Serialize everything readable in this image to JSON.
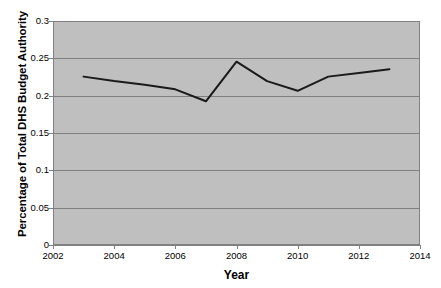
{
  "chart_data": {
    "type": "line",
    "title": "",
    "xlabel": "Year",
    "ylabel": "Percentage of Total DHS Budget Authority",
    "xlim": [
      2002,
      2014
    ],
    "ylim": [
      0,
      0.3
    ],
    "xticks": [
      2002,
      2004,
      2006,
      2008,
      2010,
      2012,
      2014
    ],
    "xtick_labels": [
      "2002",
      "2004",
      "2006",
      "2008",
      "2010",
      "2012",
      "2014"
    ],
    "yticks": [
      0,
      0.05,
      0.1,
      0.15,
      0.2,
      0.25,
      0.3
    ],
    "ytick_labels": [
      "0",
      "0.05",
      "0.1",
      "0.15",
      "0.2",
      "0.25",
      "0.3"
    ],
    "grid": "horizontal",
    "legend": "none",
    "plot_background": "#BFBFBF",
    "figure_background": "#FFFFFF",
    "gridline_color": "#808080",
    "line_color": "#1A1A1A",
    "line_width": 2,
    "x": [
      2003,
      2004,
      2005,
      2006,
      2007,
      2008,
      2009,
      2010,
      2011,
      2012,
      2013
    ],
    "values": [
      0.2255,
      0.2195,
      0.2145,
      0.2085,
      0.1925,
      0.2455,
      0.2195,
      0.2065,
      0.2255,
      0.2305,
      0.2355
    ],
    "series": [
      {
        "name": "Percentage of Total DHS Budget Authority",
        "values": [
          0.2255,
          0.2195,
          0.2145,
          0.2085,
          0.1925,
          0.2455,
          0.2195,
          0.2065,
          0.2255,
          0.2305,
          0.2355
        ]
      }
    ]
  }
}
